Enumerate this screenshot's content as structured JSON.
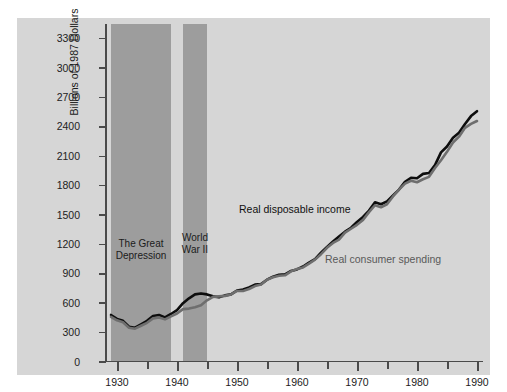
{
  "top_caption": "",
  "chart_data": {
    "type": "line",
    "title": "",
    "xlabel": "",
    "ylabel": "Billions of 1987 Dollars",
    "xlim": [
      1928,
      1991
    ],
    "ylim": [
      0,
      3450
    ],
    "grid": false,
    "legend": "inline-annotations",
    "y_ticks": [
      0,
      300,
      600,
      900,
      1200,
      1500,
      1800,
      2100,
      2400,
      2700,
      3000,
      3300
    ],
    "x_ticks_major": [
      1930,
      1940,
      1950,
      1960,
      1970,
      1980,
      1990
    ],
    "x_ticks_minor": [
      1935,
      1945,
      1955,
      1965,
      1975,
      1985
    ],
    "colors": {
      "income_line": "#0d0d0d",
      "spending_line": "#6e6e6e",
      "panel_background": "#d6d6d6",
      "band_shade": "#9d9d9d",
      "axis": "#4a4a4a"
    },
    "bands": [
      {
        "name": "The Great Depression",
        "label": "The Great\nDepression",
        "start": 1929,
        "end": 1939
      },
      {
        "name": "World War II",
        "label": "World\nWar II",
        "start": 1941,
        "end": 1945
      }
    ],
    "series": [
      {
        "name": "Real disposable income",
        "color": "#0d0d0d",
        "x": [
          1929,
          1930,
          1931,
          1932,
          1933,
          1934,
          1935,
          1936,
          1937,
          1938,
          1939,
          1940,
          1941,
          1942,
          1943,
          1944,
          1945,
          1946,
          1947,
          1948,
          1949,
          1950,
          1951,
          1952,
          1953,
          1954,
          1955,
          1956,
          1957,
          1958,
          1959,
          1960,
          1961,
          1962,
          1963,
          1964,
          1965,
          1966,
          1967,
          1968,
          1969,
          1970,
          1971,
          1972,
          1973,
          1974,
          1975,
          1976,
          1977,
          1978,
          1979,
          1980,
          1981,
          1982,
          1983,
          1984,
          1985,
          1986,
          1987,
          1988,
          1989,
          1990
        ],
        "y": [
          480,
          440,
          420,
          360,
          350,
          385,
          420,
          470,
          480,
          455,
          490,
          530,
          600,
          650,
          690,
          700,
          690,
          670,
          660,
          680,
          690,
          730,
          740,
          760,
          790,
          795,
          840,
          870,
          890,
          895,
          930,
          945,
          975,
          1015,
          1050,
          1115,
          1175,
          1230,
          1280,
          1330,
          1370,
          1430,
          1480,
          1545,
          1630,
          1610,
          1640,
          1700,
          1760,
          1840,
          1880,
          1875,
          1920,
          1930,
          2010,
          2140,
          2200,
          2290,
          2340,
          2430,
          2510,
          2560
        ]
      },
      {
        "name": "Real consumer spending",
        "color": "#6e6e6e",
        "x": [
          1929,
          1930,
          1931,
          1932,
          1933,
          1934,
          1935,
          1936,
          1937,
          1938,
          1939,
          1940,
          1941,
          1942,
          1943,
          1944,
          1945,
          1946,
          1947,
          1948,
          1949,
          1950,
          1951,
          1952,
          1953,
          1954,
          1955,
          1956,
          1957,
          1958,
          1959,
          1960,
          1961,
          1962,
          1963,
          1964,
          1965,
          1966,
          1967,
          1968,
          1969,
          1970,
          1971,
          1972,
          1973,
          1974,
          1975,
          1976,
          1977,
          1978,
          1979,
          1980,
          1981,
          1982,
          1983,
          1984,
          1985,
          1986,
          1987,
          1988,
          1989,
          1990
        ],
        "y": [
          460,
          425,
          405,
          350,
          340,
          370,
          400,
          445,
          455,
          435,
          465,
          495,
          540,
          545,
          560,
          580,
          630,
          665,
          670,
          675,
          690,
          725,
          725,
          745,
          775,
          790,
          840,
          865,
          880,
          885,
          925,
          950,
          965,
          1005,
          1045,
          1100,
          1165,
          1215,
          1250,
          1320,
          1360,
          1400,
          1450,
          1530,
          1600,
          1580,
          1610,
          1690,
          1760,
          1820,
          1850,
          1835,
          1865,
          1890,
          1980,
          2060,
          2145,
          2240,
          2300,
          2390,
          2430,
          2460
        ]
      }
    ],
    "annotations": [
      {
        "text": "Real disposable income",
        "series": "Real disposable income"
      },
      {
        "text": "Real consumer spending",
        "series": "Real consumer spending"
      }
    ]
  },
  "axis": {
    "y_title": "Billions of 1987 Dollars"
  }
}
